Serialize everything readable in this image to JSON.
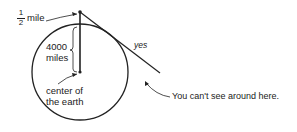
{
  "diagram": {
    "labels": {
      "half_numerator": "1",
      "half_denominator": "2",
      "half_mile_unit": "mile",
      "radius_line1": "4000",
      "radius_line2": "miles",
      "center_line1": "center of",
      "center_line2": "the earth",
      "yes": "yes",
      "callout": "You can't see around here."
    },
    "colors": {
      "stroke": "#222222",
      "background": "#ffffff"
    }
  }
}
